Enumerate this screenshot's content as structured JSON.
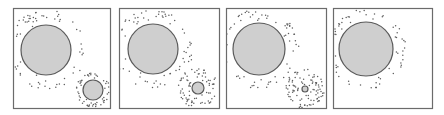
{
  "figure": {
    "width": 444,
    "height": 115,
    "background": "#ffffff",
    "frame_color": "#6b6b6b",
    "circle_fill": "#cfcfcf",
    "circle_stroke": "#5a5a5a",
    "dot_color": "#5f5f5f",
    "panels": [
      {
        "label": "panel-1",
        "frame": {
          "x": 13,
          "y": 8,
          "w": 97,
          "h": 100
        },
        "large_particle": {
          "cx": 46,
          "cy": 50,
          "r": 25
        },
        "small_particle": {
          "cx": 93,
          "cy": 90,
          "r": 10
        },
        "cloud_large": {
          "count": 70,
          "rmin": 26,
          "rmax": 40
        },
        "cloud_small": {
          "count": 55,
          "rmin": 11,
          "rmax": 17
        }
      },
      {
        "label": "panel-2",
        "frame": {
          "x": 119,
          "y": 8,
          "w": 100,
          "h": 100
        },
        "large_particle": {
          "cx": 153,
          "cy": 49,
          "r": 25
        },
        "small_particle": {
          "cx": 198,
          "cy": 88,
          "r": 6
        },
        "cloud_large": {
          "count": 70,
          "rmin": 26,
          "rmax": 40
        },
        "cloud_small": {
          "count": 75,
          "rmin": 7,
          "rmax": 20
        }
      },
      {
        "label": "panel-3",
        "frame": {
          "x": 226,
          "y": 8,
          "w": 100,
          "h": 100
        },
        "large_particle": {
          "cx": 259,
          "cy": 49,
          "r": 26
        },
        "small_particle": {
          "cx": 305,
          "cy": 89,
          "r": 3
        },
        "cloud_large": {
          "count": 70,
          "rmin": 27,
          "rmax": 40
        },
        "cloud_small": {
          "count": 95,
          "rmin": 4,
          "rmax": 20
        }
      },
      {
        "label": "panel-4",
        "frame": {
          "x": 333,
          "y": 8,
          "w": 99,
          "h": 100
        },
        "large_particle": {
          "cx": 366,
          "cy": 49,
          "r": 27
        },
        "small_particle": null,
        "cloud_large": {
          "count": 70,
          "rmin": 28,
          "rmax": 40
        },
        "cloud_small": null
      }
    ]
  }
}
